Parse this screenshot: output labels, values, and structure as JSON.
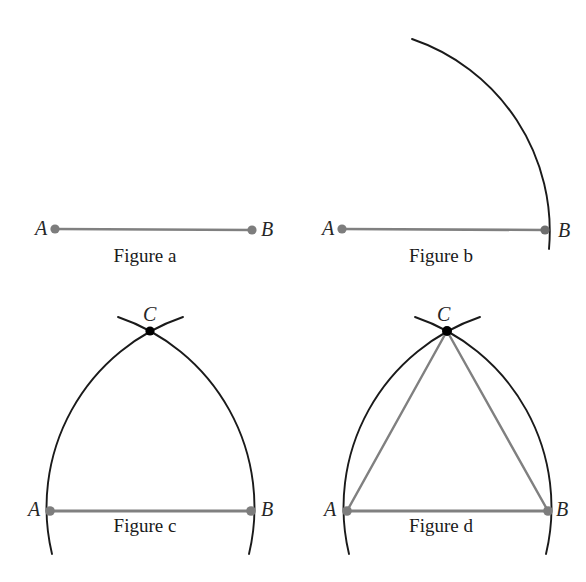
{
  "figure": {
    "panel_count": 4,
    "background_color": "#ffffff",
    "segment_color": "#808080",
    "arc_color": "#1a1a1a",
    "triangle_leg_color": "#808080",
    "endpoint_dot_color": "#808080",
    "intersection_dot_color": "#000000"
  },
  "panels": [
    {
      "id": "figure-a",
      "caption": "Figure a",
      "description": "Given segment AB",
      "points": [
        {
          "name": "A",
          "label": "A",
          "x": 55,
          "y": 229,
          "dot": "gray",
          "label_side": "left"
        },
        {
          "name": "B",
          "label": "B",
          "x": 252,
          "y": 230,
          "dot": "gray",
          "label_side": "right"
        }
      ],
      "segments": [
        {
          "from": "A",
          "to": "B",
          "color": "#808080"
        }
      ],
      "arcs": []
    },
    {
      "id": "figure-b",
      "caption": "Figure b",
      "description": "Arc centered at A with radius AB",
      "points": [
        {
          "name": "A",
          "label": "A",
          "x": 342,
          "y": 229,
          "dot": "gray",
          "label_side": "left"
        },
        {
          "name": "B",
          "label": "B",
          "x": 545,
          "y": 230,
          "dot": "gray",
          "label_side": "right"
        }
      ],
      "segments": [
        {
          "from": "A",
          "to": "B",
          "color": "#808080"
        }
      ],
      "arcs": [
        {
          "center": "A",
          "radius": 203,
          "color": "#1a1a1a",
          "from_angle": 110,
          "to_angle": -5
        }
      ]
    },
    {
      "id": "figure-c",
      "caption": "Figure c",
      "description": "Second arc centered at B; arcs intersect at C",
      "points": [
        {
          "name": "A",
          "label": "A",
          "x": 50,
          "y": 511,
          "dot": "gray",
          "label_side": "left"
        },
        {
          "name": "B",
          "label": "B",
          "x": 251,
          "y": 511,
          "dot": "gray",
          "label_side": "right"
        },
        {
          "name": "C",
          "label": "C",
          "x": 150,
          "y": 331,
          "dot": "black",
          "label_side": "above"
        }
      ],
      "segments": [
        {
          "from": "A",
          "to": "B",
          "color": "#808080"
        }
      ],
      "arcs": [
        {
          "center": "A",
          "radius": 201,
          "color": "#1a1a1a"
        },
        {
          "center": "B",
          "radius": 201,
          "color": "#1a1a1a"
        }
      ]
    },
    {
      "id": "figure-d",
      "caption": "Figure d",
      "description": "Triangle ABC drawn by joining A to C and B to C",
      "points": [
        {
          "name": "A",
          "label": "A",
          "x": 347,
          "y": 511,
          "dot": "gray",
          "label_side": "left"
        },
        {
          "name": "B",
          "label": "B",
          "x": 548,
          "y": 511,
          "dot": "gray",
          "label_side": "right"
        },
        {
          "name": "C",
          "label": "C",
          "x": 447,
          "y": 331,
          "dot": "black",
          "label_side": "above"
        }
      ],
      "segments": [
        {
          "from": "A",
          "to": "B",
          "color": "#808080"
        },
        {
          "from": "A",
          "to": "C",
          "color": "#808080"
        },
        {
          "from": "B",
          "to": "C",
          "color": "#808080"
        }
      ],
      "arcs": [
        {
          "center": "A",
          "radius": 201,
          "color": "#1a1a1a"
        },
        {
          "center": "B",
          "radius": 201,
          "color": "#1a1a1a"
        }
      ]
    }
  ],
  "labels": {
    "a_point": "A",
    "b_point": "B",
    "c_point": "C",
    "caption_a": "Figure a",
    "caption_b": "Figure b",
    "caption_c": "Figure c",
    "caption_d": "Figure d"
  }
}
